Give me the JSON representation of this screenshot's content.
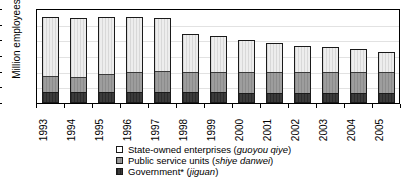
{
  "chart_data": {
    "type": "bar",
    "stacked": true,
    "title": "",
    "xlabel": "",
    "ylabel": "Million employees",
    "ylim": [
      0,
      120
    ],
    "ytick_values": [
      0,
      20,
      40,
      60,
      80,
      100,
      120
    ],
    "ytick_labels": [
      "0",
      "20",
      "40",
      "60",
      "80",
      "100",
      "120"
    ],
    "grid": true,
    "legend_position": "bottom",
    "categories": [
      "1993",
      "1994",
      "1995",
      "1996",
      "1997",
      "1998",
      "1999",
      "2000",
      "2001",
      "2002",
      "2003",
      "2004",
      "2005"
    ],
    "series": [
      {
        "name": "Government* (jiguan)",
        "key": "gov",
        "color": "#3b3b3b",
        "values": [
          13,
          13,
          13,
          13,
          13,
          13,
          13,
          12,
          12,
          12,
          12,
          12,
          12
        ]
      },
      {
        "name": "Public service units (shiye danwei)",
        "key": "psu",
        "color": "#9d9d9d",
        "values": [
          21,
          20,
          23,
          26,
          27,
          27,
          27,
          28,
          28,
          28,
          28,
          28,
          28
        ]
      },
      {
        "name": "State-owned enterprises (guoyou qiye)",
        "key": "soe",
        "color": "#ededed",
        "values": [
          76,
          75,
          74,
          71,
          68,
          48,
          45,
          41,
          36,
          33,
          31,
          29,
          25
        ]
      }
    ],
    "totals": [
      110,
      108,
      110,
      110,
      108,
      88,
      85,
      81,
      76,
      73,
      71,
      69,
      65
    ]
  },
  "legend": {
    "items": [
      {
        "swatch": "soe",
        "label_plain": "State-owned enterprises (",
        "label_italic": "guoyou qiye",
        "label_tail": ")"
      },
      {
        "swatch": "psu",
        "label_plain": "Public service units (",
        "label_italic": "shiye danwei",
        "label_tail": ")"
      },
      {
        "swatch": "gov",
        "label_plain": "Government* (",
        "label_italic": "jiguan",
        "label_tail": ")"
      }
    ]
  }
}
